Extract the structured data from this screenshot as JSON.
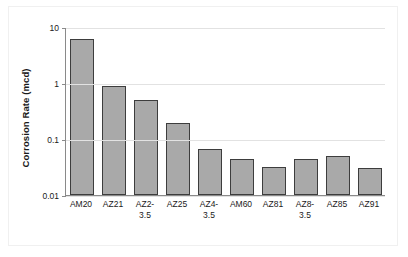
{
  "chart_data": {
    "type": "bar",
    "title": "",
    "subtitle": "",
    "xlabel": "",
    "ylabel": "Corrosion Rate (mcd)",
    "categories": [
      "AM20",
      "AZ21",
      "AZ2-3.5",
      "AZ25",
      "AZ4-3.5",
      "AM60",
      "AZ81",
      "AZ8-3.5",
      "AZ85",
      "AZ91"
    ],
    "category_lines": [
      [
        "AM20"
      ],
      [
        "AZ21"
      ],
      [
        "AZ2-",
        "3.5"
      ],
      [
        "AZ25"
      ],
      [
        "AZ4-",
        "3.5"
      ],
      [
        "AM60"
      ],
      [
        "AZ81"
      ],
      [
        "AZ8-",
        "3.5"
      ],
      [
        "AZ85"
      ],
      [
        "AZ91"
      ]
    ],
    "values": [
      6.0,
      0.9,
      0.49,
      0.19,
      0.065,
      0.044,
      0.032,
      0.044,
      0.05,
      0.03
    ],
    "yscale": "log",
    "ylim": [
      0.01,
      10
    ],
    "ytick_values": [
      10,
      1,
      0.1,
      0.01
    ],
    "ytick_labels": [
      "10",
      "1",
      "0.1",
      "0.01"
    ],
    "grid": true,
    "grid_axis": "y",
    "legend": false,
    "legend_position": "none",
    "bar_fill_color": "#a9a9a9",
    "bar_edge_color": "#3d3d3d",
    "grid_color": "#e2e2e2",
    "axis_color": "#8a8a8a",
    "background_color": "#ffffff"
  }
}
